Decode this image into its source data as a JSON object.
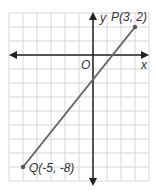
{
  "diagram": {
    "type": "coordinate-plane",
    "x_axis_label": "x",
    "y_axis_label": "y",
    "origin_label": "O",
    "points": [
      {
        "name": "P",
        "x": 3,
        "y": 2,
        "label": "P(3, 2)"
      },
      {
        "name": "Q",
        "x": -5,
        "y": -8,
        "label": "Q(-5, -8)"
      }
    ],
    "segment": {
      "from": "Q",
      "to": "P"
    },
    "colors": {
      "grid": "#d6d6d6",
      "axis": "#222222",
      "segment": "#666666",
      "background": "#ffffff"
    }
  }
}
